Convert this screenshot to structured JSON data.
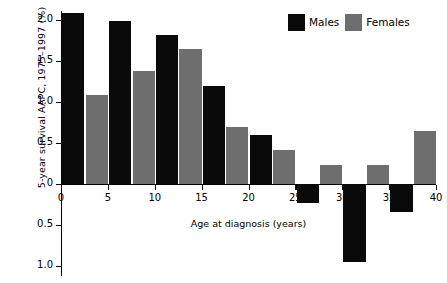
{
  "chart_data": {
    "type": "bar",
    "title": "",
    "xlabel": "Age at diagnosis (years)",
    "ylabel": "5-year survival AAPC, 1975–1997 (%)",
    "categories": [
      "0",
      "5",
      "10",
      "15",
      "20",
      "25",
      "30",
      "35"
    ],
    "category_starts": [
      0,
      5,
      10,
      15,
      20,
      25,
      30,
      35
    ],
    "series": [
      {
        "name": "Males",
        "color": "#0a0a0a",
        "values": [
          2.08,
          1.99,
          1.82,
          1.19,
          0.6,
          -0.23,
          -0.95,
          -0.34
        ]
      },
      {
        "name": "Females",
        "color": "#6e6e6e",
        "values": [
          1.08,
          1.38,
          1.65,
          0.7,
          0.42,
          0.23,
          0.23,
          0.65
        ]
      }
    ],
    "xlim": [
      0,
      40
    ],
    "ylim": [
      -1.0,
      2.0
    ],
    "xticks": [
      0,
      5,
      10,
      15,
      20,
      25,
      30,
      35,
      40
    ],
    "xtick_labels": [
      "0",
      "5",
      "10",
      "15",
      "20",
      "25",
      "30",
      "35",
      "40"
    ],
    "yticks": [
      2.0,
      1.5,
      1.0,
      0.5,
      0,
      -0.5,
      -1.0
    ],
    "ytick_labels": [
      "2.0",
      "1.5",
      "1.0",
      "0.5",
      "0",
      "0.5",
      "1.0"
    ],
    "grid": false,
    "legend_position": "top-right"
  },
  "legend": {
    "items": [
      {
        "label": "Males",
        "color": "#0a0a0a"
      },
      {
        "label": "Females",
        "color": "#6e6e6e"
      }
    ]
  }
}
